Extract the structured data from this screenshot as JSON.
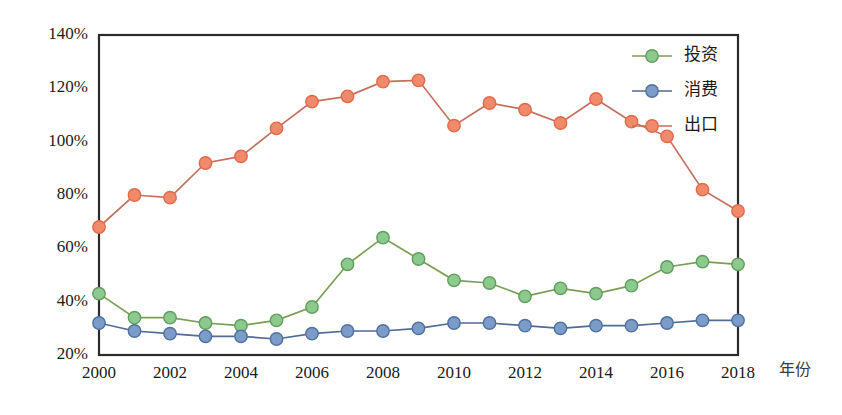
{
  "chart_data": {
    "type": "line",
    "title": "",
    "xlabel": "年份",
    "ylabel": "",
    "x": [
      2000,
      2001,
      2002,
      2003,
      2004,
      2005,
      2006,
      2007,
      2008,
      2009,
      2010,
      2011,
      2012,
      2013,
      2014,
      2015,
      2016,
      2017,
      2018
    ],
    "xtick_labels": [
      "2000",
      "2002",
      "2004",
      "2006",
      "2008",
      "2010",
      "2012",
      "2014",
      "2016",
      "2018"
    ],
    "xtick_values": [
      2000,
      2002,
      2004,
      2006,
      2008,
      2010,
      2012,
      2014,
      2016,
      2018
    ],
    "ytick_labels": [
      "20%",
      "40%",
      "60%",
      "80%",
      "100%",
      "120%",
      "140%"
    ],
    "ytick_values": [
      20,
      40,
      60,
      80,
      100,
      120,
      140
    ],
    "xlim": [
      2000,
      2018
    ],
    "ylim": [
      20,
      140
    ],
    "grid": true,
    "legend_position": "top-right",
    "series": [
      {
        "name": "投资",
        "color": "#8cc98c",
        "line_color": "#7a9e55",
        "marker_edge": "#5f9e5f",
        "values": [
          43,
          34,
          34,
          32,
          31,
          33,
          38,
          54,
          64,
          56,
          48,
          47,
          42,
          45,
          43,
          46,
          53,
          55,
          54
        ]
      },
      {
        "name": "消费",
        "color": "#7b9cc8",
        "line_color": "#4f6b96",
        "marker_edge": "#516f9e",
        "values": [
          32,
          29,
          28,
          27,
          27,
          26,
          28,
          29,
          29,
          30,
          32,
          32,
          31,
          30,
          31,
          31,
          32,
          33,
          33
        ]
      },
      {
        "name": "出口",
        "color": "#f08a6b",
        "line_color": "#c4705e",
        "marker_edge": "#e06a4a",
        "values": [
          68,
          80,
          79,
          92,
          94.5,
          105,
          115,
          117,
          122.5,
          123,
          106,
          114.5,
          112,
          107,
          116,
          107.5,
          102,
          82,
          74
        ]
      }
    ]
  },
  "legend": {
    "items": [
      {
        "label": "投资"
      },
      {
        "label": "消费"
      },
      {
        "label": "出口"
      }
    ]
  },
  "axes": {
    "x_axis_title": "年份"
  },
  "colors": {
    "investment": "#8cc98c",
    "consumption": "#7b9cc8",
    "export": "#f08a6b",
    "frame": "#2b2b2b",
    "background": "#ffffff",
    "grid": "#f0dede"
  }
}
